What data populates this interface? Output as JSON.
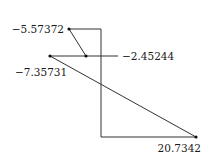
{
  "diagram": {
    "type": "node-link",
    "nodes": [
      {
        "id": "a",
        "label": "−5.57372"
      },
      {
        "id": "b",
        "label": "−2.45244"
      },
      {
        "id": "c",
        "label": "−7.35731"
      },
      {
        "id": "d",
        "label": "20.7342"
      }
    ],
    "edges": [
      {
        "from": "a",
        "to": "b",
        "style": "straight"
      },
      {
        "from": "c",
        "to": "b",
        "style": "straight"
      },
      {
        "from": "c",
        "to": "d",
        "style": "straight"
      },
      {
        "from": "a",
        "to": "d",
        "style": "orthogonal"
      },
      {
        "from": "b",
        "to": "b-label",
        "style": "leader"
      }
    ],
    "colors": {
      "edge": "#333333",
      "node": "#111111",
      "text": "#1a1a1a"
    }
  }
}
